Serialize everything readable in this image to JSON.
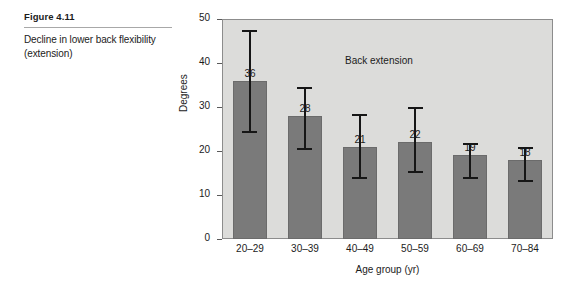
{
  "caption": {
    "figure_number": "Figure 4.11",
    "text": "Decline in lower back flexibility (extension)"
  },
  "chart_data": {
    "type": "bar",
    "title": "",
    "annotation": "Back extension",
    "xlabel": "Age group (yr)",
    "ylabel": "Degrees",
    "categories": [
      "20–29",
      "30–39",
      "40–49",
      "50–59",
      "60–69",
      "70–84"
    ],
    "values": [
      36,
      28,
      21,
      22,
      19,
      18
    ],
    "value_labels": [
      "36",
      "28",
      "21",
      "22",
      "19",
      "18"
    ],
    "error_high": [
      47.5,
      34.5,
      28.5,
      30.0,
      21.8,
      21.0
    ],
    "error_low": [
      24.5,
      20.7,
      14.0,
      15.5,
      14.0,
      13.5
    ],
    "ylim": [
      0,
      50
    ],
    "yticks": [
      0,
      10,
      20,
      30,
      40,
      50
    ],
    "ytick_labels": [
      "0",
      "10",
      "20",
      "30",
      "40",
      "50"
    ],
    "grid": false,
    "legend": "none",
    "plot_background": "#dcdcda",
    "bar_color": "#7a7a7a",
    "error_color": "#161616"
  }
}
